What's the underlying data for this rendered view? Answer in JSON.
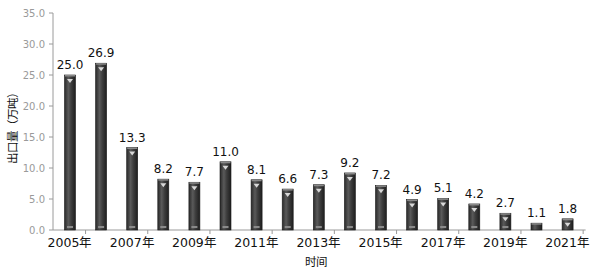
{
  "chart_data": {
    "type": "bar",
    "title": "",
    "xlabel": "时间",
    "ylabel": "出口量（万吨）",
    "ylim": [
      0,
      35
    ],
    "yticks": [
      "0.0",
      "5.0",
      "10.0",
      "15.0",
      "20.0",
      "25.0",
      "30.0",
      "35.0"
    ],
    "categories": [
      "2005年",
      "2006年",
      "2007年",
      "2008年",
      "2009年",
      "2010年",
      "2011年",
      "2012年",
      "2013年",
      "2014年",
      "2015年",
      "2016年",
      "2017年",
      "2018年",
      "2019年",
      "2020年",
      "2021年"
    ],
    "xtick_labels_shown": [
      "2005年",
      "2007年",
      "2009年",
      "2011年",
      "2013年",
      "2015年",
      "2017年",
      "2019年",
      "2021年"
    ],
    "values": [
      25.0,
      26.9,
      13.3,
      8.2,
      7.7,
      11.0,
      8.1,
      6.6,
      7.3,
      9.2,
      7.2,
      4.9,
      5.1,
      4.2,
      2.7,
      1.1,
      1.8
    ],
    "value_labels": [
      "25.0",
      "26.9",
      "13.3",
      "8.2",
      "7.7",
      "11.0",
      "8.1",
      "6.6",
      "7.3",
      "9.2",
      "7.2",
      "4.9",
      "5.1",
      "4.2",
      "2.7",
      "1.1",
      "1.8"
    ],
    "grid": false,
    "legend": null,
    "colors": {
      "bar": "#3a3a3a",
      "bar_highlight": "#6a6a6a",
      "axis": "#9a9a9a",
      "tick_text": "#9a9a9a"
    }
  }
}
